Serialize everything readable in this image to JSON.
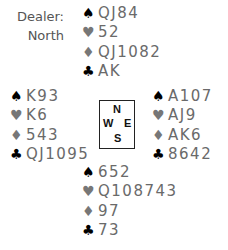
{
  "dealer": {
    "label": "Dealer:",
    "value": "North"
  },
  "hands": {
    "north": {
      "spades": "QJ84",
      "hearts": "52",
      "diamonds": "QJ1082",
      "clubs": "AK"
    },
    "west": {
      "spades": "K93",
      "hearts": "K6",
      "diamonds": "543",
      "clubs": "QJ1095"
    },
    "east": {
      "spades": "A107",
      "hearts": "AJ9",
      "diamonds": "AK6",
      "clubs": "8642"
    },
    "south": {
      "spades": "652",
      "hearts": "Q108743",
      "diamonds": "97",
      "clubs": "73"
    }
  },
  "suits": {
    "spades": "♠",
    "hearts": "♥",
    "diamonds": "♦",
    "clubs": "♣"
  },
  "compass": {
    "n": "N",
    "w": "W",
    "e": "E",
    "s": "S"
  },
  "colors": {
    "black_suit": "#000000",
    "red_suit_gray": "#777777",
    "text": "#6a6a6a"
  }
}
